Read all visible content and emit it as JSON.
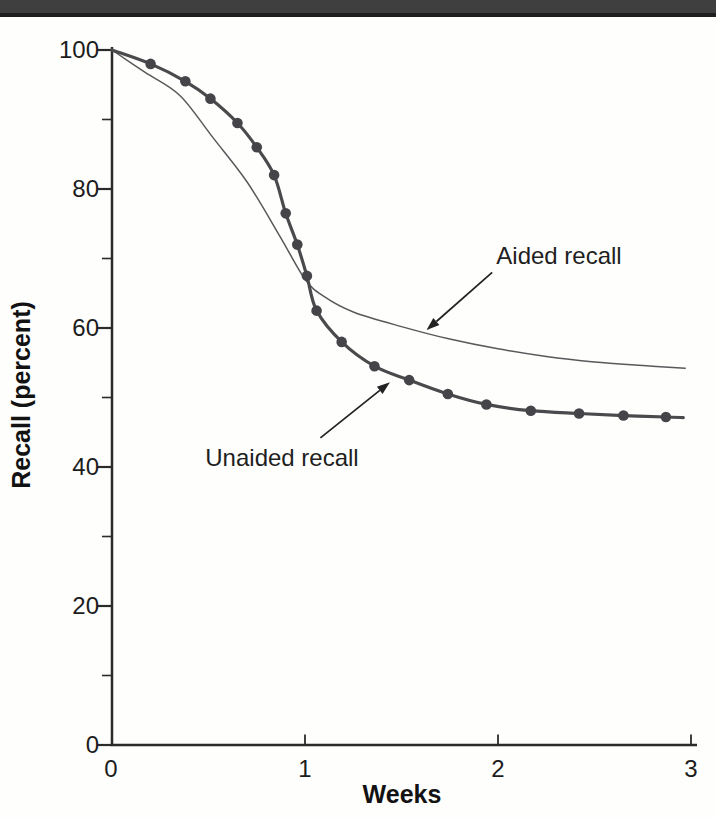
{
  "page": {
    "background": "#fefefd",
    "top_band_color": "#3f3f3f",
    "top_band_edge_color": "#1f1f1f"
  },
  "chart_data": {
    "type": "line",
    "title": "",
    "xlabel": "Weeks",
    "ylabel": "Recall (percent)",
    "xlim": [
      0,
      3
    ],
    "ylim": [
      0,
      100
    ],
    "grid": false,
    "legend_position": "direct-labels-with-arrows",
    "x_ticks": [
      {
        "v": 0,
        "label": "0"
      },
      {
        "v": 1,
        "label": "1"
      },
      {
        "v": 2,
        "label": "2"
      },
      {
        "v": 3,
        "label": "3"
      }
    ],
    "y_ticks_major": [
      {
        "v": 100,
        "label": "100"
      },
      {
        "v": 80,
        "label": "80"
      },
      {
        "v": 60,
        "label": "60"
      },
      {
        "v": 40,
        "label": "40"
      },
      {
        "v": 20,
        "label": "20"
      },
      {
        "v": 0,
        "label": "0"
      }
    ],
    "y_ticks_minor": [
      90,
      70,
      50,
      30,
      10
    ],
    "axis_color": "#2b2b2b",
    "series": [
      {
        "name": "Aided recall",
        "style": "thin-line",
        "color": "#59595c",
        "stroke_width": 1.5,
        "points": [
          [
            0,
            100
          ],
          [
            0.17,
            96.8
          ],
          [
            0.35,
            93.5
          ],
          [
            0.52,
            87.5
          ],
          [
            0.7,
            81
          ],
          [
            0.87,
            73.2
          ],
          [
            1.0,
            67
          ],
          [
            1.1,
            64.5
          ],
          [
            1.25,
            62.3
          ],
          [
            1.5,
            60.2
          ],
          [
            1.75,
            58.4
          ],
          [
            2.0,
            57
          ],
          [
            2.25,
            55.9
          ],
          [
            2.5,
            55.1
          ],
          [
            2.75,
            54.6
          ],
          [
            2.97,
            54.2
          ]
        ]
      },
      {
        "name": "Unaided recall",
        "style": "thick-line-with-dots",
        "color": "#4a4a4d",
        "marker_color": "#454549",
        "stroke_width": 3.2,
        "points": [
          [
            0,
            100
          ],
          [
            0.2,
            98
          ],
          [
            0.38,
            95.5
          ],
          [
            0.51,
            93
          ],
          [
            0.65,
            89.5
          ],
          [
            0.75,
            86
          ],
          [
            0.84,
            82
          ],
          [
            0.9,
            76.5
          ],
          [
            0.96,
            72
          ],
          [
            1.01,
            67.5
          ],
          [
            1.06,
            62.5
          ],
          [
            1.19,
            58
          ],
          [
            1.36,
            54.5
          ],
          [
            1.54,
            52.5
          ],
          [
            1.74,
            50.5
          ],
          [
            1.94,
            49
          ],
          [
            2.17,
            48.1
          ],
          [
            2.42,
            47.7
          ],
          [
            2.65,
            47.4
          ],
          [
            2.87,
            47.2
          ],
          [
            2.96,
            47.1
          ]
        ],
        "marker_points": [
          [
            0.2,
            98
          ],
          [
            0.38,
            95.5
          ],
          [
            0.51,
            93
          ],
          [
            0.65,
            89.5
          ],
          [
            0.75,
            86
          ],
          [
            0.84,
            82
          ],
          [
            0.9,
            76.5
          ],
          [
            0.96,
            72
          ],
          [
            1.01,
            67.5
          ],
          [
            1.06,
            62.5
          ],
          [
            1.19,
            58
          ],
          [
            1.36,
            54.5
          ],
          [
            1.54,
            52.5
          ],
          [
            1.74,
            50.5
          ],
          [
            1.94,
            49
          ],
          [
            2.17,
            48.1
          ],
          [
            2.42,
            47.7
          ],
          [
            2.65,
            47.4
          ],
          [
            2.87,
            47.2
          ]
        ]
      }
    ],
    "annotations": [
      {
        "text": "Aided recall",
        "arrow_from": [
          1.97,
          68.0
        ],
        "arrow_to": [
          1.63,
          59.7
        ]
      },
      {
        "text": "Unaided recall",
        "arrow_from": [
          1.08,
          44.2
        ],
        "arrow_to": [
          1.44,
          52.2
        ]
      }
    ],
    "crossing_point": [
      1.02,
      66
    ]
  }
}
